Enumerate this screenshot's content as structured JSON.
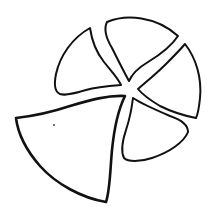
{
  "figure": {
    "stroke_color": "#111111",
    "background_color": "#ffffff",
    "pieces": [
      {
        "name": "upper-left-piece",
        "stroke_width": 2
      },
      {
        "name": "top-piece",
        "stroke_width": 2
      },
      {
        "name": "right-piece",
        "stroke_width": 2
      },
      {
        "name": "lower-right-piece",
        "stroke_width": 2
      },
      {
        "name": "displaced-lower-left-wedge",
        "stroke_width": 2.6
      }
    ],
    "annotations": [
      {
        "name": "dot-mark",
        "x": 54,
        "y": 125
      }
    ]
  }
}
